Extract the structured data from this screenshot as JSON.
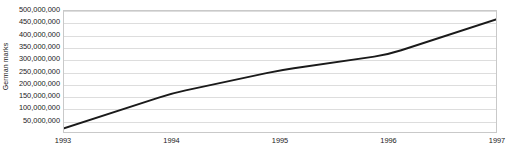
{
  "chart_data": {
    "type": "line",
    "title": "",
    "xlabel": "",
    "ylabel": "German marks",
    "x": [
      1993,
      1994,
      1995,
      1996,
      1997
    ],
    "x_tick_labels": [
      "1993",
      "1994",
      "1995",
      "1996",
      "1997"
    ],
    "values": [
      15000000,
      160000000,
      255000000,
      320000000,
      465000000
    ],
    "series": [
      {
        "name": "German marks",
        "values": [
          15000000,
          160000000,
          255000000,
          320000000,
          465000000
        ]
      }
    ],
    "ylim": [
      0,
      500000000
    ],
    "xlim": [
      1993,
      1997
    ],
    "y_tick_values": [
      50000000,
      100000000,
      150000000,
      200000000,
      250000000,
      300000000,
      350000000,
      400000000,
      450000000,
      500000000
    ],
    "y_tick_labels": [
      "50,000,000",
      "100,000,000",
      "150,000,000",
      "200,000,000",
      "250,000,000",
      "300,000,000",
      "350,000,000",
      "400,000,000",
      "450,000,000",
      "500,000,000"
    ],
    "grid": true,
    "legend": false,
    "legend_position": "none",
    "line_color": "#1a1a1a",
    "grid_color": "#dddddd",
    "border_color": "#c9c9c9",
    "background_color": "#ffffff",
    "annotations": []
  }
}
